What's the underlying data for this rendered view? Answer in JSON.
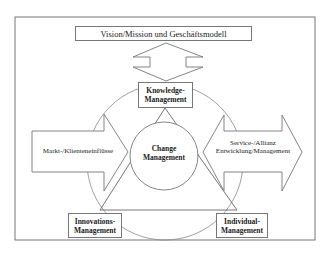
{
  "diagram": {
    "top_box": {
      "label": "Vision/Mission und Geschäftsmodell"
    },
    "nodes": {
      "knowledge": {
        "line1": "Knowledge-",
        "line2": "Management"
      },
      "change": {
        "line1": "Change",
        "line2": "Management"
      },
      "innovations": {
        "line1": "Innovations-",
        "line2": "Management"
      },
      "individual": {
        "line1": "Individual-",
        "line2": "Management"
      }
    },
    "arrows": {
      "left": {
        "label": "Markt-/Klienteneinflüsse",
        "direction": "right"
      },
      "right": {
        "line1": "Service-/Allianz",
        "line2": "Entwicklung/Management",
        "direction": "both"
      },
      "vertical": {
        "direction": "both",
        "connects": [
          "Vision/Mission und Geschäftsmodell",
          "Knowledge-Management"
        ]
      }
    },
    "colors": {
      "stroke": "#777777",
      "text": "#222222",
      "background": "#ffffff"
    }
  }
}
